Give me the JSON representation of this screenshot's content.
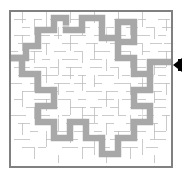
{
  "figure": {
    "type": "maze-puzzle",
    "canvas": {
      "width": 193,
      "height": 175,
      "background": "#ffffff"
    }
  },
  "maze": {
    "label": "maze-grid",
    "bounds": {
      "x": 10,
      "y": 11,
      "width": 162,
      "height": 156
    },
    "grid": {
      "cols": 40,
      "rows": 38,
      "cell": 4
    },
    "colors": {
      "background": "#ffffff",
      "wall": "#b9b9b9",
      "border": "#808080",
      "solution": "#a8a8a8",
      "solution_edge": "#8f8f8f",
      "marker": "#000000"
    },
    "entrance": {
      "side": "left",
      "x": 10,
      "y": 58
    },
    "exit": {
      "side": "right",
      "x": 172,
      "y": 65
    }
  },
  "marker": {
    "label": "exit-arrow",
    "shape": "triangle-left",
    "color": "#000000",
    "x": 173,
    "y": 58,
    "width": 9,
    "height": 14
  },
  "chart_data": {
    "type": "maze",
    "grid_cols": 40,
    "grid_rows": 38,
    "cell_size": 4,
    "walls_h": [
      [
        0,
        0,
        40
      ],
      [
        0,
        38,
        40
      ],
      [
        2,
        2,
        4
      ],
      [
        6,
        2,
        3
      ],
      [
        11,
        2,
        4
      ],
      [
        16,
        2,
        2
      ],
      [
        20,
        2,
        3
      ],
      [
        25,
        2,
        2
      ],
      [
        29,
        2,
        4
      ],
      [
        34,
        2,
        3
      ],
      [
        1,
        4,
        3
      ],
      [
        5,
        4,
        2
      ],
      [
        9,
        4,
        3
      ],
      [
        14,
        4,
        4
      ],
      [
        19,
        4,
        2
      ],
      [
        23,
        4,
        3
      ],
      [
        27,
        4,
        2
      ],
      [
        31,
        4,
        4
      ],
      [
        36,
        4,
        3
      ],
      [
        3,
        6,
        2
      ],
      [
        7,
        6,
        4
      ],
      [
        12,
        6,
        3
      ],
      [
        17,
        6,
        2
      ],
      [
        21,
        6,
        4
      ],
      [
        26,
        6,
        3
      ],
      [
        30,
        6,
        2
      ],
      [
        35,
        6,
        4
      ],
      [
        1,
        8,
        4
      ],
      [
        6,
        8,
        3
      ],
      [
        10,
        8,
        2
      ],
      [
        15,
        8,
        4
      ],
      [
        20,
        8,
        3
      ],
      [
        24,
        8,
        2
      ],
      [
        28,
        8,
        4
      ],
      [
        33,
        8,
        3
      ],
      [
        37,
        8,
        2
      ],
      [
        2,
        10,
        3
      ],
      [
        8,
        10,
        2
      ],
      [
        13,
        10,
        4
      ],
      [
        18,
        10,
        3
      ],
      [
        22,
        10,
        2
      ],
      [
        27,
        10,
        4
      ],
      [
        32,
        10,
        3
      ],
      [
        36,
        10,
        3
      ],
      [
        0,
        12,
        2
      ],
      [
        4,
        12,
        4
      ],
      [
        11,
        12,
        3
      ],
      [
        16,
        12,
        2
      ],
      [
        21,
        12,
        4
      ],
      [
        26,
        12,
        3
      ],
      [
        31,
        12,
        2
      ],
      [
        35,
        12,
        4
      ],
      [
        3,
        14,
        3
      ],
      [
        7,
        14,
        2
      ],
      [
        12,
        14,
        4
      ],
      [
        18,
        14,
        3
      ],
      [
        23,
        14,
        2
      ],
      [
        28,
        14,
        4
      ],
      [
        34,
        14,
        3
      ],
      [
        1,
        16,
        4
      ],
      [
        6,
        16,
        3
      ],
      [
        10,
        16,
        2
      ],
      [
        14,
        16,
        4
      ],
      [
        20,
        16,
        3
      ],
      [
        25,
        16,
        2
      ],
      [
        30,
        16,
        4
      ],
      [
        36,
        16,
        3
      ],
      [
        2,
        18,
        2
      ],
      [
        8,
        18,
        4
      ],
      [
        13,
        18,
        3
      ],
      [
        17,
        18,
        2
      ],
      [
        22,
        18,
        4
      ],
      [
        27,
        18,
        3
      ],
      [
        33,
        18,
        2
      ],
      [
        37,
        18,
        2
      ],
      [
        0,
        20,
        3
      ],
      [
        5,
        20,
        2
      ],
      [
        11,
        20,
        4
      ],
      [
        16,
        20,
        3
      ],
      [
        21,
        20,
        2
      ],
      [
        26,
        20,
        4
      ],
      [
        31,
        20,
        3
      ],
      [
        35,
        20,
        4
      ],
      [
        3,
        22,
        4
      ],
      [
        9,
        22,
        3
      ],
      [
        14,
        22,
        2
      ],
      [
        19,
        22,
        4
      ],
      [
        24,
        22,
        3
      ],
      [
        29,
        22,
        2
      ],
      [
        34,
        22,
        4
      ],
      [
        1,
        24,
        2
      ],
      [
        6,
        24,
        4
      ],
      [
        12,
        24,
        3
      ],
      [
        17,
        24,
        2
      ],
      [
        22,
        24,
        4
      ],
      [
        28,
        24,
        3
      ],
      [
        32,
        24,
        2
      ],
      [
        36,
        24,
        3
      ],
      [
        4,
        26,
        3
      ],
      [
        10,
        26,
        2
      ],
      [
        15,
        26,
        4
      ],
      [
        20,
        26,
        3
      ],
      [
        25,
        26,
        2
      ],
      [
        30,
        26,
        4
      ],
      [
        35,
        26,
        3
      ],
      [
        0,
        28,
        4
      ],
      [
        7,
        28,
        3
      ],
      [
        13,
        28,
        2
      ],
      [
        18,
        28,
        4
      ],
      [
        23,
        28,
        3
      ],
      [
        27,
        28,
        2
      ],
      [
        32,
        28,
        4
      ],
      [
        37,
        28,
        2
      ],
      [
        2,
        30,
        3
      ],
      [
        8,
        30,
        2
      ],
      [
        14,
        30,
        4
      ],
      [
        19,
        30,
        3
      ],
      [
        24,
        30,
        2
      ],
      [
        29,
        30,
        4
      ],
      [
        34,
        30,
        3
      ],
      [
        5,
        32,
        2
      ],
      [
        11,
        32,
        4
      ],
      [
        16,
        32,
        3
      ],
      [
        21,
        32,
        2
      ],
      [
        26,
        32,
        4
      ],
      [
        31,
        32,
        3
      ],
      [
        36,
        32,
        3
      ],
      [
        1,
        34,
        4
      ],
      [
        9,
        34,
        3
      ],
      [
        15,
        34,
        2
      ],
      [
        20,
        34,
        4
      ],
      [
        25,
        34,
        3
      ],
      [
        30,
        34,
        2
      ],
      [
        35,
        34,
        4
      ],
      [
        3,
        36,
        3
      ],
      [
        7,
        36,
        2
      ],
      [
        13,
        36,
        4
      ],
      [
        18,
        36,
        3
      ],
      [
        23,
        36,
        2
      ],
      [
        28,
        36,
        4
      ],
      [
        33,
        36,
        3
      ]
    ],
    "walls_v": [
      [
        0,
        0,
        38
      ],
      [
        40,
        0,
        38
      ],
      [
        3,
        0,
        3
      ],
      [
        3,
        6,
        4
      ],
      [
        3,
        14,
        3
      ],
      [
        3,
        22,
        4
      ],
      [
        3,
        30,
        3
      ],
      [
        6,
        2,
        4
      ],
      [
        6,
        10,
        3
      ],
      [
        6,
        18,
        4
      ],
      [
        6,
        26,
        3
      ],
      [
        6,
        34,
        3
      ],
      [
        9,
        0,
        4
      ],
      [
        9,
        8,
        3
      ],
      [
        9,
        16,
        4
      ],
      [
        9,
        24,
        3
      ],
      [
        9,
        32,
        4
      ],
      [
        12,
        4,
        3
      ],
      [
        12,
        12,
        4
      ],
      [
        12,
        20,
        3
      ],
      [
        12,
        28,
        4
      ],
      [
        12,
        36,
        2
      ],
      [
        15,
        0,
        3
      ],
      [
        15,
        6,
        4
      ],
      [
        15,
        14,
        3
      ],
      [
        15,
        22,
        4
      ],
      [
        15,
        30,
        3
      ],
      [
        18,
        2,
        4
      ],
      [
        18,
        10,
        3
      ],
      [
        18,
        18,
        4
      ],
      [
        18,
        26,
        3
      ],
      [
        18,
        34,
        3
      ],
      [
        21,
        0,
        3
      ],
      [
        21,
        8,
        4
      ],
      [
        21,
        16,
        3
      ],
      [
        21,
        24,
        4
      ],
      [
        21,
        32,
        4
      ],
      [
        24,
        4,
        4
      ],
      [
        24,
        12,
        3
      ],
      [
        24,
        20,
        4
      ],
      [
        24,
        28,
        3
      ],
      [
        24,
        36,
        2
      ],
      [
        27,
        0,
        3
      ],
      [
        27,
        6,
        4
      ],
      [
        27,
        14,
        3
      ],
      [
        27,
        22,
        4
      ],
      [
        27,
        30,
        4
      ],
      [
        30,
        2,
        4
      ],
      [
        30,
        10,
        4
      ],
      [
        30,
        18,
        3
      ],
      [
        30,
        26,
        4
      ],
      [
        30,
        34,
        3
      ],
      [
        33,
        0,
        4
      ],
      [
        33,
        8,
        3
      ],
      [
        33,
        16,
        4
      ],
      [
        33,
        24,
        3
      ],
      [
        33,
        32,
        4
      ],
      [
        36,
        4,
        3
      ],
      [
        36,
        12,
        4
      ],
      [
        36,
        20,
        3
      ],
      [
        36,
        28,
        4
      ],
      [
        36,
        36,
        2
      ]
    ],
    "solution_path": [
      [
        0,
        12
      ],
      [
        4,
        12
      ],
      [
        4,
        9
      ],
      [
        7,
        9
      ],
      [
        7,
        5
      ],
      [
        11,
        5
      ],
      [
        11,
        2
      ],
      [
        16,
        2
      ],
      [
        16,
        6
      ],
      [
        20,
        6
      ],
      [
        20,
        2
      ],
      [
        26,
        2
      ],
      [
        26,
        7
      ],
      [
        30,
        7
      ],
      [
        30,
        3
      ],
      [
        34,
        3
      ],
      [
        34,
        8
      ],
      [
        30,
        8
      ],
      [
        30,
        12
      ],
      [
        34,
        12
      ],
      [
        34,
        16
      ],
      [
        38,
        16
      ],
      [
        38,
        13
      ],
      [
        40,
        13
      ],
      [
        38,
        13
      ],
      [
        38,
        16
      ],
      [
        34,
        16
      ],
      [
        34,
        20
      ],
      [
        30,
        20
      ],
      [
        30,
        24
      ],
      [
        34,
        24
      ],
      [
        34,
        28
      ],
      [
        30,
        28
      ],
      [
        30,
        32
      ],
      [
        26,
        32
      ],
      [
        26,
        36
      ],
      [
        22,
        36
      ],
      [
        22,
        32
      ],
      [
        18,
        32
      ],
      [
        18,
        28
      ],
      [
        14,
        28
      ],
      [
        14,
        32
      ],
      [
        10,
        32
      ],
      [
        10,
        28
      ],
      [
        6,
        28
      ],
      [
        6,
        24
      ],
      [
        10,
        24
      ],
      [
        10,
        20
      ],
      [
        6,
        20
      ],
      [
        6,
        16
      ],
      [
        2,
        16
      ],
      [
        2,
        12
      ],
      [
        0,
        12
      ]
    ],
    "legend": [],
    "xlabel": "",
    "ylabel": ""
  }
}
